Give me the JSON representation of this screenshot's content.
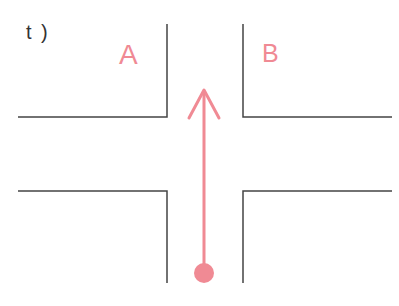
{
  "question_label": "t )",
  "zones": {
    "a": "A",
    "b": "B"
  },
  "colors": {
    "road_edge": "#444444",
    "accent": "#f08a94",
    "label_text": "#333333"
  },
  "diagram": {
    "type": "intersection",
    "arrow_direction": "straight-up",
    "arrow_start": "bottom dot in lower road lane",
    "arrow_end": "intersection top entry"
  }
}
